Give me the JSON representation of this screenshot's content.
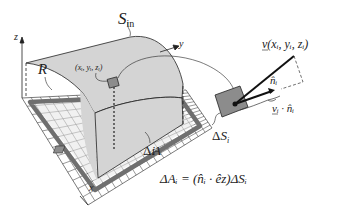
{
  "labels": {
    "axis_z": "z",
    "axis_y": "y",
    "axis_x": "x",
    "surface": "S",
    "surface_sub": "in",
    "region": "R",
    "point": "(x",
    "point_full": "(xᵢ, yᵢ, zᵢ)",
    "delta_A": "ΔA",
    "delta_A_sub": "i",
    "delta_S": "ΔS",
    "delta_S_sub": "i",
    "velocity": "v(xᵢ, yᵢ, zᵢ)",
    "normal": "n̂ᵢ",
    "dot_product": "vᵢ · n̂ᵢ",
    "equation": "ΔAᵢ = (n̂ᵢ · êz)ΔSᵢ"
  },
  "colors": {
    "surface": "#d4d4d4",
    "patch": "#8c8c8c",
    "region_border": "#6f6f6f",
    "grid_cell": "#e6e6e6",
    "ink": "#111111"
  }
}
